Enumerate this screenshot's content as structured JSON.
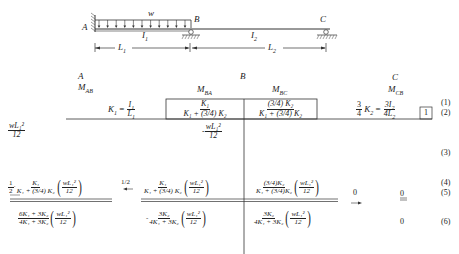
{
  "beam": {
    "node_a": "A",
    "node_b": "B",
    "node_c": "C",
    "load": "w",
    "i1": "I",
    "i1_sub": "1",
    "i2": "I",
    "i2_sub": "2",
    "l1": "L",
    "l1_sub": "1",
    "l2": "L",
    "l2_sub": "2"
  },
  "table": {
    "joints": {
      "a": "A",
      "b": "B",
      "c": "C"
    },
    "moments": {
      "mab": "M",
      "mab_sub": "AB",
      "mba": "M",
      "mba_sub": "BA",
      "mbc": "M",
      "mbc_sub": "BC",
      "mcb": "M",
      "mcb_sub": "CB"
    },
    "row_numbers": [
      "(1)",
      "(2)",
      "(3)",
      "(4)",
      "(5)",
      "(6)"
    ],
    "stiffness": {
      "k1_label": "K",
      "k1_sub": "1",
      "equals": "=",
      "i1_num": "I",
      "l1_den": "L",
      "k2_coef_num": "3",
      "k2_coef_den": "4",
      "k2_label": "K",
      "k2_sub": "2",
      "i2_num": "3I",
      "l2_den": "4L"
    },
    "df_ba": {
      "num": "K₁",
      "den": "K₁ + (3/4) K₂"
    },
    "df_bc": {
      "num": "(3/4) K₂",
      "den": "K₁ + (3/4) K₂"
    },
    "df_cb": "1",
    "fem_ab": {
      "num": "wL₁²",
      "den": "12"
    },
    "fem_ba": {
      "sign": "-",
      "num": "wL₁²",
      "den": "12"
    },
    "carry": {
      "half": "1/2",
      "coef_num": "1",
      "coef_den": "2",
      "dot": "·",
      "k_num": "K₁",
      "k_den": "K₁ + (3/4) K₂",
      "w_num": "wL₁²",
      "w_den": "12",
      "arrow_left": "←",
      "arrow_right": "→"
    },
    "dist_ba": {
      "k_num": "K₁",
      "k_den": "K₁ + (3/4) K₂",
      "w_num": "wL₁²",
      "w_den": "12"
    },
    "dist_bc": {
      "k_num": "(3/4)K₂",
      "k_den": "K₁ + (3/4)K₂",
      "w_num": "wL₁²",
      "w_den": "12"
    },
    "carry_c": "0",
    "mcb_row5": "0",
    "final": {
      "ab": {
        "num": "6K₁ + 3K₂",
        "den": "4K₁ + 3K₂",
        "w_num": "wL₁²",
        "w_den": "12"
      },
      "ba": {
        "sign": "-",
        "num": "3K₂",
        "den": "4K₁ + 3K₂",
        "w_num": "wL₁²",
        "w_den": "12"
      },
      "bc": {
        "num": "3K₂",
        "den": "4K₁ + 3K₂",
        "w_num": "wL₁²",
        "w_den": "12"
      },
      "cb": "0"
    }
  }
}
